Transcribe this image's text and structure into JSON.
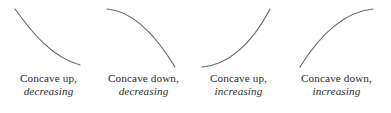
{
  "figure": {
    "background_color": "#ffffff",
    "curve_color": "#6a6a6a",
    "text_color": "#2b2b2b"
  },
  "chart_data": {
    "type": "line",
    "title": "",
    "subtitle": "",
    "xlabel": "",
    "ylabel": "",
    "grid": false,
    "legend": "none",
    "axes_shown": false,
    "panels": [
      {
        "index": 1,
        "caption_line1": "Concave up,",
        "caption_line2": "decreasing",
        "concavity": "up",
        "monotonicity": "decreasing",
        "path": "M 15 9 C 33 34, 52 57, 80 65",
        "start_point": [
          15,
          9
        ],
        "end_point": [
          80,
          65
        ],
        "slope_start": "steep negative",
        "slope_end": "near zero"
      },
      {
        "index": 2,
        "caption_line1": "Concave down,",
        "caption_line2": "decreasing",
        "concavity": "down",
        "monotonicity": "decreasing",
        "path": "M 12 9 C 38 11, 60 34, 80 67",
        "start_point": [
          12,
          9
        ],
        "end_point": [
          80,
          67
        ],
        "slope_start": "near zero",
        "slope_end": "steep negative"
      },
      {
        "index": 3,
        "caption_line1": "Concave up,",
        "caption_line2": "increasing",
        "concavity": "up",
        "monotonicity": "increasing",
        "path": "M 12 67 C 38 65, 62 44, 80 9",
        "start_point": [
          12,
          67
        ],
        "end_point": [
          80,
          9
        ],
        "slope_start": "near zero",
        "slope_end": "steep positive"
      },
      {
        "index": 4,
        "caption_line1": "Concave down,",
        "caption_line2": "increasing",
        "concavity": "down",
        "monotonicity": "increasing",
        "path": "M 12 67 C 30 38, 55 12, 85 9",
        "start_point": [
          12,
          67
        ],
        "end_point": [
          85,
          9
        ],
        "slope_start": "steep positive",
        "slope_end": "near zero"
      }
    ]
  }
}
